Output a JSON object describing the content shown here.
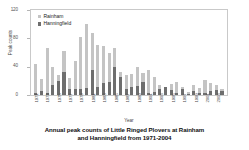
{
  "chart_data": {
    "type": "bar",
    "stacked": true,
    "title": "",
    "xlabel": "Year",
    "ylabel": "Peak counts",
    "ylim": [
      0,
      120
    ],
    "yticks": [
      0,
      40,
      80,
      120
    ],
    "grid": false,
    "legend_position": "top-left-inside",
    "categories": [
      "1971",
      "1972",
      "1973",
      "1974",
      "1975",
      "1976",
      "1977",
      "1978",
      "1979",
      "1980",
      "1981",
      "1982",
      "1983",
      "1984",
      "1985",
      "1986",
      "1987",
      "1988",
      "1989",
      "1990",
      "1991",
      "1992",
      "1993",
      "1994",
      "1995",
      "1996",
      "1997",
      "1998",
      "1999",
      "2000",
      "2001",
      "2002",
      "2003",
      "2004"
    ],
    "tick_labels": [
      "1971",
      "",
      "1973",
      "",
      "1975",
      "",
      "1977",
      "",
      "1979",
      "",
      "1981",
      "",
      "1983",
      "",
      "1985",
      "",
      "1987",
      "",
      "1989",
      "",
      "1991",
      "",
      "1993",
      "",
      "1995",
      "",
      "1997",
      "",
      "1999",
      "",
      "2001",
      "",
      "2003",
      ""
    ],
    "series": [
      {
        "name": "Rainham",
        "color": "#c4c4c4",
        "values": [
          44,
          22,
          66,
          39,
          28,
          62,
          24,
          48,
          82,
          100,
          87,
          71,
          69,
          60,
          67,
          33,
          28,
          30,
          39,
          31,
          36,
          25,
          14,
          12,
          16,
          18,
          12,
          4,
          14,
          10,
          21,
          17,
          14,
          9
        ]
      },
      {
        "name": "Hanningfield",
        "color": "#6e6e6e",
        "values": [
          3,
          6,
          3,
          14,
          20,
          33,
          9,
          9,
          8,
          10,
          36,
          11,
          17,
          19,
          40,
          26,
          9,
          11,
          13,
          19,
          3,
          4,
          8,
          12,
          7,
          3,
          8,
          2,
          6,
          3,
          3,
          6,
          7,
          5
        ]
      }
    ]
  },
  "legend": {
    "items": [
      {
        "label": "Rainham",
        "color": "#c4c4c4"
      },
      {
        "label": "Hanningfield",
        "color": "#6e6e6e"
      }
    ]
  },
  "axes": {
    "y_label": "Peak counts",
    "x_label": "Year",
    "y_tick_labels": [
      "120",
      "80",
      "40",
      "0"
    ]
  },
  "caption": {
    "line1": "Annual peak counts of Little Ringed Plovers at Rainham",
    "line2": "and Hanningfield from 1971-2004"
  }
}
